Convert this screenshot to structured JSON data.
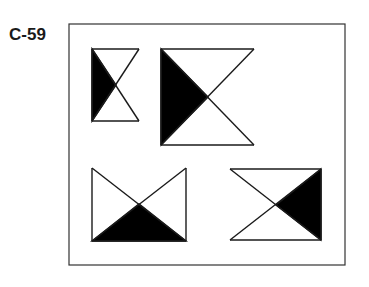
{
  "label": "C-59",
  "colors": {
    "stroke": "#1a1a1a",
    "fill": "#000000",
    "frame": "#333333",
    "background": "#ffffff"
  },
  "frame": {
    "x": 69,
    "y": 24,
    "w": 276,
    "h": 241
  },
  "figures": [
    {
      "id": "hourglass-small",
      "shaded_side": "left",
      "box": [
        92,
        49,
        139,
        121
      ],
      "center": [
        116,
        85
      ],
      "open_side": "right"
    },
    {
      "id": "hourglass-large",
      "shaded_side": "left",
      "box": [
        161,
        49,
        254,
        145
      ],
      "center": [
        208,
        97
      ],
      "open_side": "right"
    },
    {
      "id": "bowtie-bottom-shaded",
      "shaded_side": "bottom",
      "box": [
        92,
        168,
        186,
        241
      ],
      "center": [
        139,
        204
      ],
      "open_side": "top"
    },
    {
      "id": "bowtie-right-shaded",
      "shaded_side": "right",
      "box": [
        230,
        169,
        321,
        240
      ],
      "center": [
        276,
        205
      ],
      "open_side": "left"
    }
  ]
}
